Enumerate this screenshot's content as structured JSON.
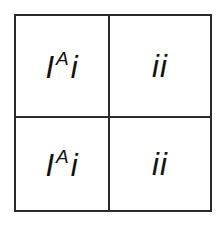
{
  "punnett_square": {
    "rows": 2,
    "cols": 2,
    "cells": [
      {
        "position": "top-left",
        "base": "I",
        "superscript": "A",
        "allele": "i"
      },
      {
        "position": "top-right",
        "text": "ii"
      },
      {
        "position": "bottom-left",
        "base": "I",
        "superscript": "A",
        "allele": "i"
      },
      {
        "position": "bottom-right",
        "text": "ii"
      }
    ],
    "colors": {
      "border": "#2a2a2a",
      "text": "#111111",
      "background": "#ffffff"
    }
  }
}
